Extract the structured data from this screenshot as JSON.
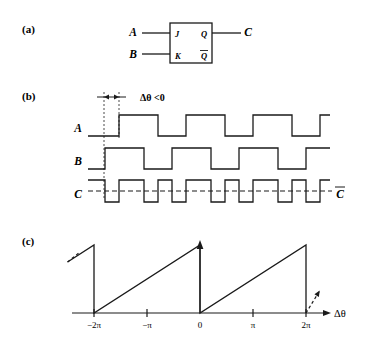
{
  "figure": {
    "panels": [
      {
        "key": "a",
        "label": "(a)",
        "x": 22,
        "y": 33
      },
      {
        "key": "b",
        "label": "(b)",
        "x": 22,
        "y": 100
      },
      {
        "key": "c",
        "label": "(c)",
        "x": 22,
        "y": 245
      }
    ]
  },
  "panel_a": {
    "title": "JK flip-flop schematic",
    "box": {
      "x": 170,
      "y": 23,
      "w": 42,
      "h": 40
    },
    "inputs": [
      {
        "name": "A",
        "label": "A",
        "label_x": 133,
        "label_y": 36,
        "wire_y": 33,
        "wire_x1": 142,
        "wire_x2": 170
      },
      {
        "name": "B",
        "label": "B",
        "label_x": 133,
        "label_y": 58,
        "wire_y": 54,
        "wire_x1": 142,
        "wire_x2": 170
      }
    ],
    "outputs": [
      {
        "name": "C",
        "label": "C",
        "label_x": 248,
        "label_y": 36,
        "wire_y": 33,
        "wire_x1": 212,
        "wire_x2": 241
      }
    ],
    "pins": [
      {
        "name": "J",
        "label": "J",
        "x": 175,
        "y": 37
      },
      {
        "name": "K",
        "label": "K",
        "x": 175,
        "y": 58
      },
      {
        "name": "Q",
        "label": "Q",
        "x": 201,
        "y": 37,
        "overbar": false
      },
      {
        "name": "Qbar",
        "label": "Q",
        "x": 201,
        "y": 59,
        "overbar": true
      }
    ]
  },
  "panel_b": {
    "title": "Timing waveforms",
    "annotation": {
      "text": "Δθ <0",
      "x": 140,
      "y": 102
    },
    "phase_marker": {
      "left_x": 104,
      "right_x": 119,
      "arrow_y": 97,
      "dash_top": 92,
      "dash_bottom": 200
    },
    "traces": [
      {
        "name": "A",
        "label": "A",
        "label_x": 78,
        "label_y": 132,
        "high_y": 115,
        "low_y": 136,
        "x_start": 88,
        "x_end": 330,
        "edges": [
          119,
          158,
          186,
          225,
          253,
          292,
          320
        ],
        "initial": "low"
      },
      {
        "name": "B",
        "label": "B",
        "label_x": 78,
        "label_y": 165,
        "high_y": 148,
        "low_y": 169,
        "x_start": 88,
        "x_end": 330,
        "edges": [
          105,
          144,
          172,
          211,
          239,
          278,
          306
        ],
        "initial": "low"
      },
      {
        "name": "C",
        "label": "C",
        "label_x": 78,
        "label_y": 198,
        "high_y": 180,
        "low_y": 202,
        "x_start": 88,
        "x_end": 330,
        "edges": [
          105,
          119,
          144,
          158,
          172,
          186,
          211,
          225,
          239,
          253,
          278,
          292,
          306,
          320
        ],
        "initial": "high"
      }
    ],
    "cbar": {
      "label": "C",
      "x": 340,
      "y": 196,
      "overbar": true
    },
    "dashed_level": {
      "y": 191,
      "x1": 88,
      "x2": 332
    }
  },
  "chart_data": {
    "type": "line",
    "xlabel": "Δθ",
    "ylabel": "",
    "xlim": [
      -7.85,
      7.85
    ],
    "ylim": [
      0,
      1
    ],
    "grid": false,
    "legend": false,
    "xticks": [
      -6.283,
      -3.142,
      0,
      3.142,
      6.283
    ],
    "xticklabels": [
      "−2π",
      "−π",
      "0",
      "π",
      "2π"
    ],
    "series": [
      {
        "name": "sawtooth",
        "points": [
          [
            -7.85,
            0.75
          ],
          [
            -6.283,
            1.0
          ],
          [
            -6.283,
            0.0
          ],
          [
            0.0,
            1.0
          ],
          [
            0.0,
            0.0
          ],
          [
            6.283,
            1.0
          ],
          [
            6.283,
            0.0
          ]
        ]
      }
    ],
    "dashed_continuations": [
      {
        "from": [
          -7.85,
          0.75
        ],
        "to": [
          -7.2,
          0.88
        ]
      },
      {
        "from": [
          6.283,
          0.0
        ],
        "to": [
          7.1,
          0.33
        ]
      }
    ],
    "axis_label_x": 330,
    "axis_label_y": 303
  },
  "panel_c": {
    "plot_box": {
      "left": 72,
      "right": 312,
      "baseline_y": 313,
      "peak_y": 245
    },
    "x_origin_px": 200,
    "px_per_2pi": 106,
    "tick_half_height": 4,
    "ticks": [
      {
        "label": "−2π",
        "x": 94
      },
      {
        "label": "−π",
        "x": 147
      },
      {
        "label": "0",
        "x": 200
      },
      {
        "label": "π",
        "x": 253
      },
      {
        "label": "2π",
        "x": 306
      }
    ],
    "tick_label_y": 328,
    "axis_arrow_end_x": 330,
    "vertical_arrow_top_y": 240,
    "axis_label": "Δθ"
  },
  "style": {
    "stroke": "#1a1a1a",
    "background": "#ffffff",
    "line_width": 1.3
  }
}
